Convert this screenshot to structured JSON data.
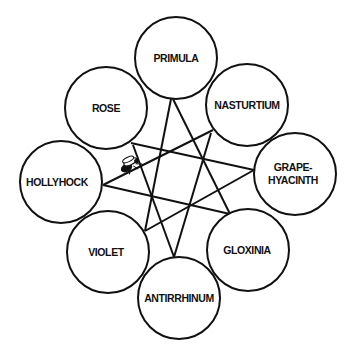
{
  "diagram": {
    "type": "network",
    "nodes": [
      {
        "id": "primula",
        "label": "PRIMULA",
        "cx": 176,
        "cy": 58,
        "r": 41
      },
      {
        "id": "rose",
        "label": "ROSE",
        "cx": 106,
        "cy": 108,
        "r": 41
      },
      {
        "id": "nasturtium",
        "label": "NASTURTIUM",
        "cx": 247,
        "cy": 105,
        "r": 41
      },
      {
        "id": "grape-hyacinth",
        "label": "GRAPE-\nHYACINTH",
        "cx": 295,
        "cy": 174,
        "r": 41
      },
      {
        "id": "hollyhock",
        "label": "HOLLYHOCK",
        "cx": 61,
        "cy": 182,
        "r": 41
      },
      {
        "id": "violet",
        "label": "VIOLET",
        "cx": 108,
        "cy": 252,
        "r": 41
      },
      {
        "id": "gloxinia",
        "label": "GLOXINIA",
        "cx": 248,
        "cy": 250,
        "r": 41
      },
      {
        "id": "antirrhinum",
        "label": "ANTIRRHINUM",
        "cx": 179,
        "cy": 298,
        "r": 41
      }
    ],
    "edges": [
      {
        "from": "primula",
        "to": "violet",
        "x1": 171,
        "y1": 99,
        "x2": 145,
        "y2": 231
      },
      {
        "from": "primula",
        "to": "gloxinia",
        "x1": 173,
        "y1": 99,
        "x2": 230,
        "y2": 214
      },
      {
        "from": "rose",
        "to": "grape-hyacinth",
        "x1": 131,
        "y1": 143,
        "x2": 254,
        "y2": 170
      },
      {
        "from": "rose",
        "to": "antirrhinum",
        "x1": 133,
        "y1": 145,
        "x2": 174,
        "y2": 257
      },
      {
        "from": "nasturtium",
        "to": "hollyhock",
        "x1": 213,
        "y1": 130,
        "x2": 103,
        "y2": 185
      },
      {
        "from": "nasturtium",
        "to": "antirrhinum",
        "x1": 211,
        "y1": 133,
        "x2": 174,
        "y2": 257
      },
      {
        "from": "hollyhock",
        "to": "gloxinia",
        "x1": 103,
        "y1": 185,
        "x2": 230,
        "y2": 214
      },
      {
        "from": "grape-hyacinth",
        "to": "violet",
        "x1": 254,
        "y1": 170,
        "x2": 145,
        "y2": 231
      }
    ],
    "insect": {
      "name": "fly-icon",
      "x": 128,
      "y": 164
    }
  }
}
